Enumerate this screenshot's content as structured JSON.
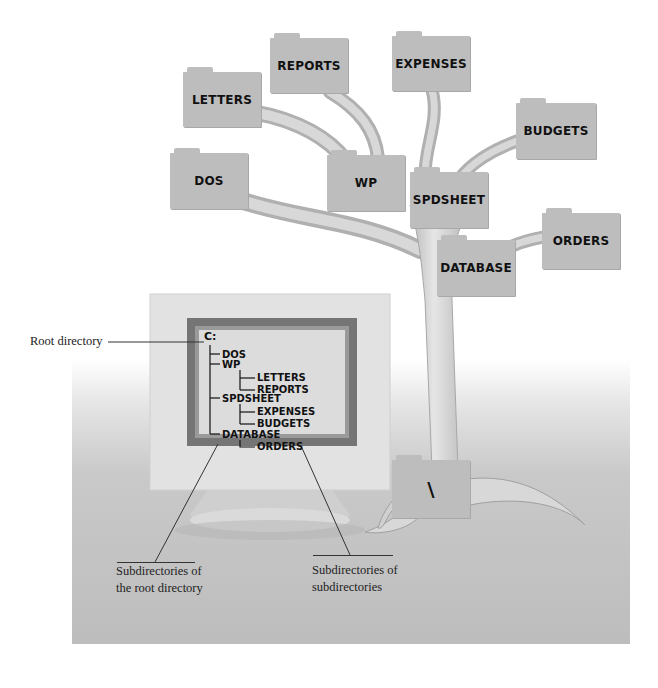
{
  "tree_folders": [
    {
      "id": "letters",
      "label": "LETTERS",
      "x": 183,
      "y": 72,
      "w": 78,
      "h": 55
    },
    {
      "id": "reports",
      "label": "REPORTS",
      "x": 270,
      "y": 38,
      "w": 78,
      "h": 55
    },
    {
      "id": "expenses",
      "label": "EXPENSES",
      "x": 392,
      "y": 36,
      "w": 78,
      "h": 55
    },
    {
      "id": "budgets",
      "label": "BUDGETS",
      "x": 516,
      "y": 103,
      "w": 80,
      "h": 56
    },
    {
      "id": "dos",
      "label": "DOS",
      "x": 170,
      "y": 153,
      "w": 78,
      "h": 56
    },
    {
      "id": "wp",
      "label": "WP",
      "x": 327,
      "y": 155,
      "w": 78,
      "h": 56
    },
    {
      "id": "spdsheet",
      "label": "SPDSHEET",
      "x": 410,
      "y": 172,
      "w": 78,
      "h": 56
    },
    {
      "id": "orders",
      "label": "ORDERS",
      "x": 542,
      "y": 213,
      "w": 78,
      "h": 56
    },
    {
      "id": "database",
      "label": "DATABASE",
      "x": 437,
      "y": 240,
      "w": 78,
      "h": 56
    },
    {
      "id": "root",
      "label": "\\",
      "x": 392,
      "y": 460,
      "w": 78,
      "h": 58
    }
  ],
  "screen_listing": {
    "root": "C:",
    "items": [
      {
        "label": "DOS",
        "level": 1
      },
      {
        "label": "WP",
        "level": 1
      },
      {
        "label": "LETTERS",
        "level": 2
      },
      {
        "label": "REPORTS",
        "level": 2
      },
      {
        "label": "SPDSHEET",
        "level": 1
      },
      {
        "label": "EXPENSES",
        "level": 2
      },
      {
        "label": "BUDGETS",
        "level": 2
      },
      {
        "label": "DATABASE",
        "level": 1
      },
      {
        "label": "ORDERS",
        "level": 2
      }
    ]
  },
  "captions": {
    "root_directory": "Root directory",
    "subdirs_root_line1": "Subdirectories of",
    "subdirs_root_line2": "the root directory",
    "subdirs_sub_line1": "Subdirectories of",
    "subdirs_sub_line2": "subdirectories"
  },
  "colors": {
    "folder": "#bdbdbd",
    "branch": "#cfcfcf",
    "screen_frame": "#757575",
    "screen_glass": "#dcdcdc"
  }
}
